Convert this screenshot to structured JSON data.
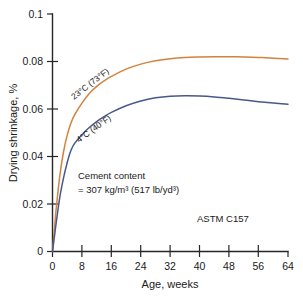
{
  "chart_data": {
    "type": "line",
    "title": "",
    "xlabel": "Age, weeks",
    "ylabel": "Drying shrinkage, %",
    "xlim": [
      0,
      64
    ],
    "ylim": [
      0,
      0.1
    ],
    "grid": false,
    "legend_position": "inline-curve-labels",
    "xticks": [
      "0",
      "8",
      "16",
      "24",
      "32",
      "40",
      "48",
      "56",
      "64"
    ],
    "xtick_values": [
      0,
      8,
      16,
      24,
      32,
      40,
      48,
      56,
      64
    ],
    "yticks": [
      "0",
      "0.02",
      "0.04",
      "0.06",
      "0.08",
      "0.1"
    ],
    "ytick_values": [
      0,
      0.02,
      0.04,
      0.06,
      0.08,
      0.1
    ],
    "series": [
      {
        "name": "23°C (73°F)",
        "color": "#d4823c",
        "label_text": "23°C (73°F)",
        "x": [
          0,
          0.5,
          1,
          2,
          3,
          4,
          5,
          6,
          8,
          10,
          12,
          14,
          16,
          20,
          24,
          28,
          32,
          36,
          40,
          44,
          48,
          52,
          56,
          60,
          64
        ],
        "values": [
          0,
          0.009,
          0.018,
          0.032,
          0.042,
          0.049,
          0.054,
          0.0575,
          0.0625,
          0.0665,
          0.0695,
          0.0718,
          0.0737,
          0.0768,
          0.0789,
          0.0803,
          0.0812,
          0.0817,
          0.0819,
          0.082,
          0.082,
          0.0819,
          0.0817,
          0.0814,
          0.0811
        ]
      },
      {
        "name": "4°C (40°F)",
        "color": "#48588c",
        "label_text": "4°C (40°F)",
        "x": [
          0,
          0.5,
          1,
          2,
          3,
          4,
          5,
          6,
          8,
          10,
          12,
          14,
          16,
          20,
          24,
          28,
          32,
          36,
          40,
          44,
          48,
          52,
          56,
          60,
          64
        ],
        "values": [
          0,
          0.006,
          0.012,
          0.023,
          0.031,
          0.0375,
          0.0425,
          0.0455,
          0.0492,
          0.0522,
          0.0547,
          0.0568,
          0.0586,
          0.0614,
          0.0634,
          0.0647,
          0.0654,
          0.0656,
          0.0655,
          0.0651,
          0.0645,
          0.0638,
          0.0631,
          0.0625,
          0.062
        ]
      }
    ],
    "annotations": [
      {
        "name": "cement-content-note",
        "line1": "Cement content",
        "line2": "= 307 kg/m³  (517 lb/yd³)"
      },
      {
        "name": "standard-note",
        "text": "ASTM C157"
      }
    ]
  }
}
